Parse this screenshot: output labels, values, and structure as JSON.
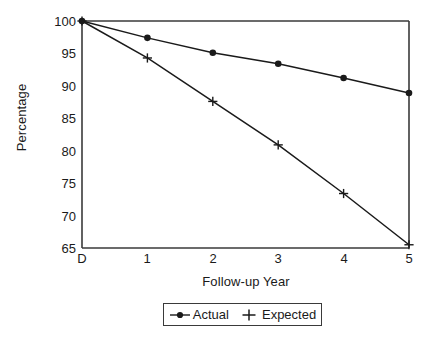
{
  "chart_data": {
    "type": "line",
    "title": "",
    "xlabel": "Follow-up Year",
    "ylabel": "Percentage",
    "x_tick_labels": [
      "D",
      "1",
      "2",
      "3",
      "4",
      "5"
    ],
    "x_values": [
      0,
      1,
      2,
      3,
      4,
      5
    ],
    "y_tick_labels": [
      "65",
      "70",
      "75",
      "80",
      "85",
      "90",
      "95",
      "100"
    ],
    "y_ticks": [
      65,
      70,
      75,
      80,
      85,
      90,
      95,
      100
    ],
    "ylim": [
      65,
      100
    ],
    "xlim": [
      0,
      5
    ],
    "grid": false,
    "legend_position": "below-axis-center",
    "series": [
      {
        "name": "Actual",
        "marker": "filled-circle",
        "color": "#1a1a1a",
        "values": [
          100,
          97.4,
          95.1,
          93.4,
          91.2,
          88.9
        ]
      },
      {
        "name": "Expected",
        "marker": "plus",
        "color": "#1a1a1a",
        "values": [
          100,
          94.3,
          87.6,
          80.9,
          73.4,
          65.5
        ]
      }
    ]
  },
  "legend": {
    "items": [
      {
        "label": "Actual",
        "marker": "filled-circle"
      },
      {
        "label": "Expected",
        "marker": "plus"
      }
    ]
  },
  "axes": {
    "left_px": 82,
    "right_px": 409,
    "top_px": 21,
    "bottom_px": 248,
    "line_color": "#3a3a3a"
  }
}
